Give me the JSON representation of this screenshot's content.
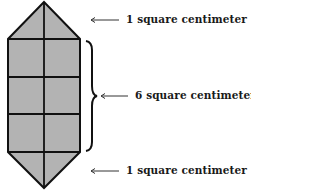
{
  "diagram": {
    "type": "area-decomposition",
    "shape": {
      "fill_color": "#b3b3b3",
      "stroke_color": "#111111",
      "top_triangle": {
        "area_label": "1 square centimeter"
      },
      "rectangle": {
        "rows": 3,
        "cols": 2,
        "area_label": "6 square centimeters"
      },
      "bottom_triangle": {
        "area_label": "1 square centimeter"
      }
    },
    "labels": {
      "top": "1 square centimeter",
      "middle": "6 square centimeters",
      "bottom": "1 square centimeter"
    }
  }
}
